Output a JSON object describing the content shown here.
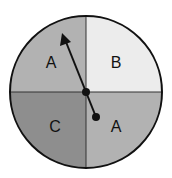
{
  "spinner": {
    "sections": [
      {
        "position": "top-left",
        "label": "A",
        "color": "#b2b2b2"
      },
      {
        "position": "top-right",
        "label": "B",
        "color": "#ececec"
      },
      {
        "position": "bottom-left",
        "label": "C",
        "color": "#8e8e8e"
      },
      {
        "position": "bottom-right",
        "label": "A",
        "color": "#b2b2b2"
      }
    ],
    "pointer": {
      "points_to": "A"
    }
  }
}
